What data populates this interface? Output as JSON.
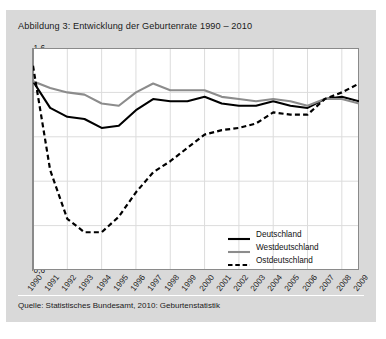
{
  "figure": {
    "title": "Abbildung 3: Entwicklung der Geburtenrate 1990 – 2010",
    "source": "Quelle: Statistisches Bundesamt, 2010: Geburtenstatistik",
    "background_color": "#d9d9d9",
    "plot_background_color": "#ffffff"
  },
  "colors": {
    "deutschland": "#000000",
    "westdeutschland": "#8c8c8c",
    "ostdeutschland": "#000000",
    "gridline": "#dcdcdc",
    "axis": "#8a8a8a"
  },
  "legend": {
    "position": "bottom-right",
    "items": [
      {
        "label": "Deutschland",
        "color": "#000000",
        "style": "solid",
        "width": 2.1
      },
      {
        "label": "Westdeutschland",
        "color": "#8c8c8c",
        "style": "solid",
        "width": 2.1
      },
      {
        "label": "Ostdeutschland",
        "color": "#000000",
        "style": "dashed",
        "width": 2.1
      }
    ]
  },
  "chart_data": {
    "type": "line",
    "title": "Abbildung 3: Entwicklung der Geburtenrate 1990 – 2010",
    "xlabel": "",
    "ylabel": "",
    "ylim": [
      0.6,
      1.6
    ],
    "yticks": [
      1.6,
      1.4,
      1.2,
      1.0,
      0.8,
      0.6
    ],
    "ytick_labels": [
      "1,6",
      "1,4",
      "1,2",
      "1,0",
      "0,8",
      "0,6"
    ],
    "grid": true,
    "x": [
      1990,
      1991,
      1992,
      1993,
      1994,
      1995,
      1996,
      1997,
      1998,
      1999,
      2000,
      2001,
      2002,
      2003,
      2004,
      2005,
      2006,
      2007,
      2008,
      2009
    ],
    "xtick_labels": [
      "1990",
      "1991",
      "1992",
      "1993",
      "1994",
      "1995",
      "1996",
      "1997",
      "1998",
      "1999",
      "2000",
      "2001",
      "2002",
      "2003",
      "2004",
      "2005",
      "2006",
      "2007",
      "2008",
      "2009"
    ],
    "series": [
      {
        "name": "Deutschland",
        "color": "#000000",
        "style": "solid",
        "values": [
          1.45,
          1.33,
          1.29,
          1.28,
          1.24,
          1.25,
          1.32,
          1.37,
          1.36,
          1.36,
          1.38,
          1.35,
          1.34,
          1.34,
          1.36,
          1.34,
          1.33,
          1.37,
          1.38,
          1.36
        ]
      },
      {
        "name": "Westdeutschland",
        "color": "#8c8c8c",
        "style": "solid",
        "values": [
          1.45,
          1.42,
          1.4,
          1.39,
          1.35,
          1.34,
          1.4,
          1.44,
          1.41,
          1.41,
          1.41,
          1.38,
          1.37,
          1.36,
          1.37,
          1.36,
          1.34,
          1.37,
          1.37,
          1.35
        ]
      },
      {
        "name": "Ostdeutschland",
        "color": "#000000",
        "style": "dashed",
        "values": [
          1.52,
          1.05,
          0.83,
          0.77,
          0.77,
          0.84,
          0.95,
          1.04,
          1.09,
          1.15,
          1.21,
          1.23,
          1.24,
          1.26,
          1.31,
          1.3,
          1.3,
          1.37,
          1.4,
          1.44
        ]
      }
    ]
  }
}
